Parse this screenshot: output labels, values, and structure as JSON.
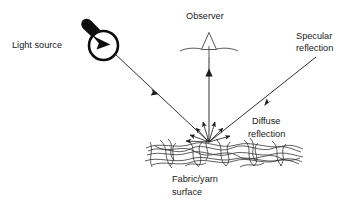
{
  "diagram": {
    "background_color": "#ffffff",
    "stroke_color": "#1a1a1a",
    "labels": {
      "light_source": "Light source",
      "observer": "Observer",
      "specular_reflection_line1": "Specular",
      "specular_reflection_line2": "reflection",
      "diffuse_reflection_line1": "Diffuse",
      "diffuse_reflection_line2": "reflection",
      "surface_line1": "Fabric/yarn",
      "surface_line2": "surface"
    },
    "elements": {
      "light_bulb": "light-bulb-icon",
      "eye": "observer-eye-icon",
      "incident_ray": "incident-light-ray",
      "specular_ray": "specular-reflection-ray",
      "observer_ray": "observer-view-ray",
      "diffuse_rays": "diffuse-reflection-rays",
      "fabric": "fabric-yarn-surface"
    }
  }
}
